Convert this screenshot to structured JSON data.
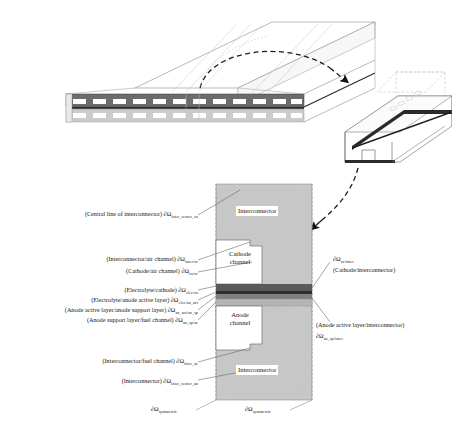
{
  "figure": {
    "colors": {
      "interconnector_fill": "#c9c9c9",
      "cathode_band": "#6a6a6a",
      "anode_band": "#c0c0c0",
      "electrolyte": "#4a4a4a",
      "channel_white": "#ffffff",
      "line": "#4d4d4d",
      "text": "#171717"
    }
  },
  "cross_section": {
    "regions": [
      {
        "name": "interconnector-top",
        "label": "Interconnector"
      },
      {
        "name": "cathode-channel",
        "label_line1": "Cathode",
        "label_line2": "channel"
      },
      {
        "name": "anode-channel",
        "label_line1": "Anode",
        "label_line2": "channel"
      },
      {
        "name": "interconnector-bottom",
        "label": "Interconnector"
      }
    ]
  },
  "labels_left": [
    {
      "id": "inter-center-ca",
      "text": "(Central line of interconnector) ∂Ω",
      "sub": "inter_center_ca"
    },
    {
      "id": "inter-ca",
      "text": "(Interconnector/air channel) ∂Ω",
      "sub": "inter/cc"
    },
    {
      "id": "ca-cc",
      "text": "(Cathode/air channel) ∂Ω",
      "sub": "ca/cc"
    },
    {
      "id": "elec-ca",
      "text": "(Electrolyte/cathode) ∂Ω",
      "sub": "elec/ca"
    },
    {
      "id": "elec-an-act",
      "text": "(Electrolyte/anode active layer) ∂Ω",
      "sub": "elec/an_act"
    },
    {
      "id": "an-act-an-sp",
      "text": "(Anode active layer/anode support layer) ∂Ω",
      "sub": "an_act/an_sp"
    },
    {
      "id": "an-sp-ac",
      "text": "(Anode support layer/fuel channel) ∂Ω",
      "sub": "an_sp/ac"
    },
    {
      "id": "inter-ac",
      "text": "(Interconnector/fuel channel) ∂Ω",
      "sub": "inter_ac"
    },
    {
      "id": "inter-center-an",
      "text": "(Interconnector) ∂Ω",
      "sub": "inter_center_an"
    }
  ],
  "labels_right": [
    {
      "id": "ca-inter",
      "symbol": "∂Ω",
      "sub": "ca/inter",
      "caption": "(Cathode/interconnector)"
    },
    {
      "id": "an-sp-inter",
      "caption": "(Anode active layer/interconnector)",
      "symbol": "∂Ω",
      "sub": "an_sp/inter"
    }
  ],
  "labels_bottom": [
    {
      "id": "sym-left",
      "symbol": "∂Ω",
      "sub": "symmetric"
    },
    {
      "id": "sym-right",
      "symbol": "∂Ω",
      "sub": "symmetric"
    }
  ]
}
